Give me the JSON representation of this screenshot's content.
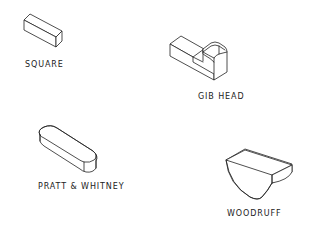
{
  "diagram": {
    "line_color": "#222222",
    "background": "#ffffff",
    "keys": [
      {
        "id": "square",
        "label": "SQUARE"
      },
      {
        "id": "gib-head",
        "label": "GIB HEAD"
      },
      {
        "id": "pratt-whitney",
        "label": "PRATT & WHITNEY"
      },
      {
        "id": "woodruff",
        "label": "WOODRUFF"
      }
    ]
  }
}
